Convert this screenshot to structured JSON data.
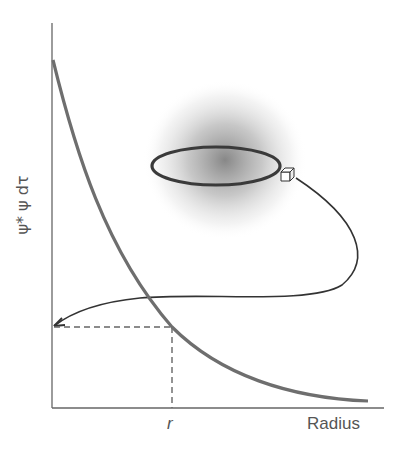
{
  "diagram": {
    "y_axis_label": "ψ* ψ dτ",
    "x_axis_label": "Radius",
    "marker_label": "r",
    "colors": {
      "curve": "#6e6e6e",
      "axis": "#666666",
      "cloud": "#7a7a7a"
    },
    "elements": [
      "probability-density-curve",
      "electron-cloud",
      "orbit-ring",
      "volume-element-cube",
      "leader-arrow",
      "dashed-guide-lines"
    ]
  }
}
